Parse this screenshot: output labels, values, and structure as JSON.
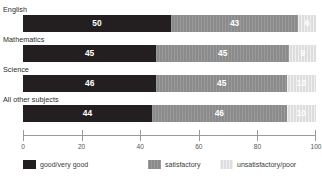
{
  "chart_data": {
    "type": "bar",
    "orientation": "horizontal",
    "stacked": true,
    "stacked_percent": true,
    "title": "",
    "subtitle": "",
    "xlabel": "",
    "ylabel": "",
    "xlim": [
      0,
      100
    ],
    "grid": false,
    "legend_position": "bottom",
    "categories": [
      "English",
      "Mathematics",
      "Science",
      "All other subjects"
    ],
    "series": [
      {
        "name": "good/very good",
        "color": "#231f20",
        "values": [
          50,
          45,
          46,
          44
        ]
      },
      {
        "name": "satisfactory",
        "color": "#8b8b8b",
        "values": [
          43,
          45,
          45,
          46
        ]
      },
      {
        "name": "unsatisfactory/poor",
        "color": "#dddddd",
        "values": [
          6,
          9,
          10,
          10
        ]
      }
    ],
    "axis": {
      "ticks": [
        0,
        20,
        40,
        60,
        80,
        100
      ],
      "tick_labels": [
        "0",
        "20",
        "40",
        "60",
        "80",
        "100"
      ]
    }
  },
  "rows": [
    {
      "label": "English",
      "segments": [
        {
          "key": "good",
          "value": 50,
          "value_label": "50"
        },
        {
          "key": "sat",
          "value": 43,
          "value_label": "43"
        },
        {
          "key": "unsat",
          "value": 6,
          "value_label": "6"
        }
      ]
    },
    {
      "label": "Mathematics",
      "segments": [
        {
          "key": "good",
          "value": 45,
          "value_label": "45"
        },
        {
          "key": "sat",
          "value": 45,
          "value_label": "45"
        },
        {
          "key": "unsat",
          "value": 9,
          "value_label": "9"
        }
      ]
    },
    {
      "label": "Science",
      "segments": [
        {
          "key": "good",
          "value": 46,
          "value_label": "46"
        },
        {
          "key": "sat",
          "value": 45,
          "value_label": "45"
        },
        {
          "key": "unsat",
          "value": 10,
          "value_label": "10"
        }
      ]
    },
    {
      "label": "All other subjects",
      "segments": [
        {
          "key": "good",
          "value": 44,
          "value_label": "44"
        },
        {
          "key": "sat",
          "value": 46,
          "value_label": "46"
        },
        {
          "key": "unsat",
          "value": 10,
          "value_label": "10"
        }
      ]
    }
  ],
  "axis": {
    "tick_labels": [
      "0",
      "20",
      "40",
      "60",
      "80",
      "100"
    ],
    "tick_values": [
      0,
      20,
      40,
      60,
      80,
      100
    ]
  },
  "legend": {
    "items": [
      {
        "key": "good",
        "label": "good/very good",
        "color": "#231f20"
      },
      {
        "key": "sat",
        "label": "satisfactory",
        "color": "#8b8b8b"
      },
      {
        "key": "unsat",
        "label": "unsatisfactory/poor",
        "color": "#dddddd"
      }
    ]
  },
  "footnote": {
    "text": ""
  }
}
